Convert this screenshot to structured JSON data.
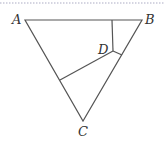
{
  "diagram": {
    "type": "geometry-triangle",
    "colors": {
      "line": "#555555",
      "label": "#333333",
      "border_dots": "#c8c8d8"
    },
    "points": {
      "A": {
        "x": 25,
        "y": 20
      },
      "B": {
        "x": 142,
        "y": 20
      },
      "C": {
        "x": 83,
        "y": 121
      },
      "D": {
        "x": 113,
        "y": 51
      }
    },
    "labels": {
      "A": "A",
      "B": "B",
      "C": "C",
      "D": "D"
    },
    "segments": [
      {
        "from": "A",
        "to": "B"
      },
      {
        "from": "A",
        "to": "C"
      },
      {
        "from": "B",
        "to": "C"
      },
      {
        "from": "D",
        "to": "point on AB (112,20)"
      },
      {
        "from": "D",
        "to": "point on BC (122,55)"
      },
      {
        "from": "D",
        "to": "point on AC (60,80)"
      }
    ]
  }
}
